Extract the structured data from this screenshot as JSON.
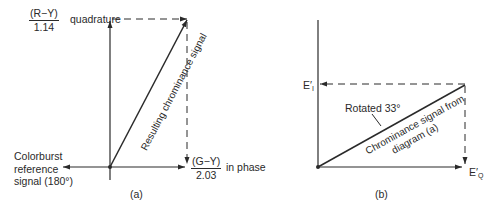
{
  "diagram_a": {
    "caption": "(a)",
    "quadrature_label": {
      "numerator": "(R−Y)",
      "denominator": "1.14",
      "suffix": "quadrature"
    },
    "inphase_label": {
      "numerator": "(G−Y)",
      "denominator": "2.03",
      "suffix": "in phase"
    },
    "colorburst_label": [
      "Colorburst",
      "reference",
      "signal (180°)"
    ],
    "vector_label": "Resulting chrominance signal"
  },
  "diagram_b": {
    "caption": "(b)",
    "ei_label": {
      "main": "E",
      "prime": "′",
      "sub": "I"
    },
    "eq_label": {
      "main": "E",
      "prime": "′",
      "sub": "Q"
    },
    "rotation_label": "Rotated 33°",
    "vector_label_line1": "Chrominance signal from",
    "vector_label_line2": "diagram (a)"
  },
  "colors": {
    "line": "#2a2a2a",
    "background": "#ffffff"
  }
}
